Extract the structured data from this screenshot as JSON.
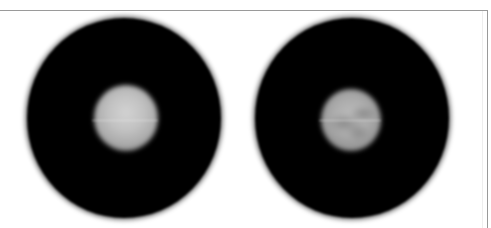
{
  "figure": {
    "panels": [
      {
        "id": "left",
        "description": "blurred black circular field with bright uniform grey disc at center",
        "outer_color": "#000000",
        "core_color": "#c2c2c2"
      },
      {
        "id": "right",
        "description": "blurred black circular field with mottled grey disc at center",
        "outer_color": "#000000",
        "core_color": "#acacac"
      }
    ],
    "frame_color": "#9a9a9a",
    "background_color": "#ffffff"
  }
}
